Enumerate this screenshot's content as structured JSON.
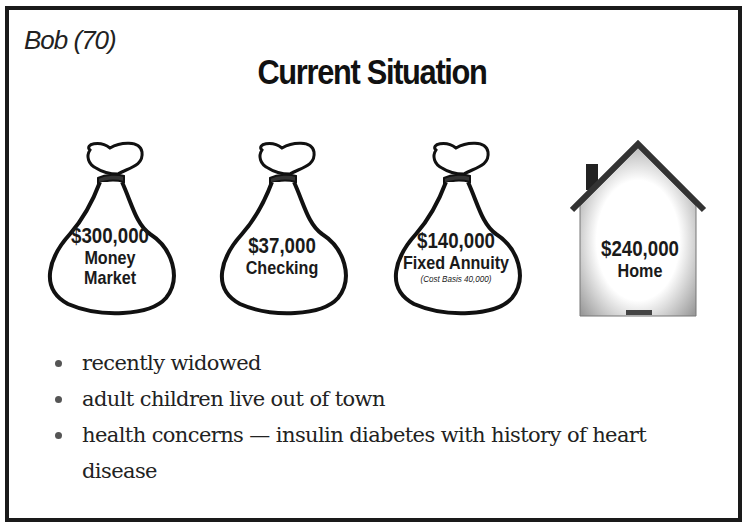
{
  "slide": {
    "client_name": "Bob (70)",
    "title": "Current Situation"
  },
  "assets": [
    {
      "icon": "money-bag-icon",
      "amount": "$300,000",
      "type_line1": "Money",
      "type_line2": "Market",
      "note": ""
    },
    {
      "icon": "money-bag-icon",
      "amount": "$37,000",
      "type_line1": "Checking",
      "type_line2": "",
      "note": ""
    },
    {
      "icon": "money-bag-icon",
      "amount": "$140,000",
      "type_line1": "Fixed Annuity",
      "type_line2": "",
      "note": "(Cost Basis 40,000)"
    },
    {
      "icon": "house-icon",
      "amount": "$240,000",
      "type_line1": "Home",
      "type_line2": "",
      "note": ""
    }
  ],
  "bullets": [
    "recently widowed",
    "adult children live out of town",
    "health concerns — insulin diabetes with history of heart disease"
  ],
  "colors": {
    "border": "#1a1a1a",
    "text": "#222222",
    "background": "#ffffff"
  }
}
